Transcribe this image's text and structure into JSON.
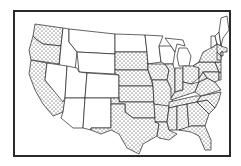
{
  "map": {
    "title": "",
    "subject": "Contiguous United States",
    "style": "outline map, stippled states vs blank states",
    "colors": {
      "outline": "#222222",
      "stipple": "#222222",
      "background": "#ffffff",
      "frame": "#2a2a2a"
    },
    "legend": [],
    "stippled_states": [
      "WA",
      "OR",
      "CA",
      "SD",
      "NE",
      "KS",
      "OK",
      "TX",
      "IA",
      "MO",
      "AR",
      "LA",
      "IL",
      "IN",
      "OH",
      "KY",
      "TN",
      "MS",
      "AL",
      "GA",
      "FL",
      "SC",
      "NC",
      "VA",
      "WV",
      "MD",
      "DE",
      "PA",
      "NJ",
      "NY",
      "CT",
      "RI",
      "MA"
    ],
    "blank_states": [
      "ID",
      "MT",
      "WY",
      "NV",
      "UT",
      "CO",
      "AZ",
      "NM",
      "ND",
      "MN",
      "WI",
      "MI",
      "ME",
      "NH",
      "VT"
    ]
  }
}
